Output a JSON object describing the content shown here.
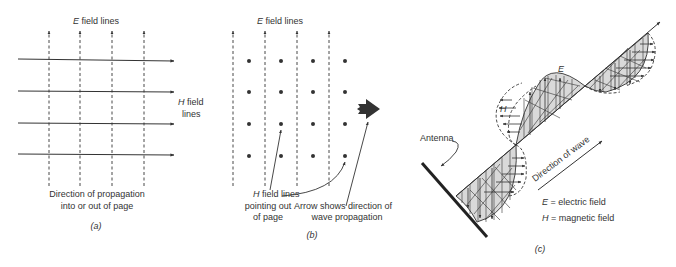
{
  "panel_a": {
    "e_label_var": "E",
    "e_label_text": " field lines",
    "h_label_var": "H",
    "h_label_text1": " field",
    "h_label_text2": "lines",
    "caption_line1": "Direction of propagation",
    "caption_line2": "into or out of page",
    "panel_label": "(a)",
    "e_lines_x": [
      49,
      80,
      112,
      144
    ],
    "h_lines_y": [
      60,
      92,
      124,
      155
    ]
  },
  "panel_b": {
    "e_label_var": "E",
    "e_label_text": " field lines",
    "h_caption_var": "H",
    "h_caption_line1": " field lines",
    "h_caption_line2": "pointing out",
    "h_caption_line3": "of page",
    "arrow_caption_line1": "Arrow shows direction of",
    "arrow_caption_line2": "wave propagation",
    "panel_label": "(b)",
    "e_lines_x": [
      233,
      265,
      297,
      329
    ],
    "dots_x": [
      249,
      281,
      313,
      345
    ],
    "dots_y": [
      61,
      92,
      124,
      156
    ]
  },
  "panel_c": {
    "antenna_label": "Antenna",
    "e_wave_label": "E",
    "h_wave_label": "H",
    "direction_label": "Direction of wave",
    "legend": [
      {
        "var": "E",
        "text": " = electric field"
      },
      {
        "var": "H",
        "text": " = magnetic field"
      }
    ],
    "panel_label": "(c)"
  },
  "colors": {
    "line": "#333333",
    "fill": "#d9d9d9",
    "text": "#333333"
  }
}
